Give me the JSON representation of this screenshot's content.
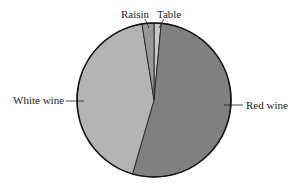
{
  "chart_data": {
    "type": "pie",
    "title": "",
    "categories": [
      "Table",
      "Red wine",
      "White wine",
      "Raisin"
    ],
    "values": [
      1.5,
      53,
      43,
      2.5
    ],
    "units": "percent (estimated)",
    "start_angle_deg": 0,
    "direction": "clockwise",
    "colors": {
      "Table": "#c8c8c8",
      "Red wine": "#808080",
      "White wine": "#b4b4b4",
      "Raisin": "#999999"
    },
    "labels": {
      "Table": "Table",
      "Red wine": "Red wine",
      "White wine": "White wine",
      "Raisin": "Raisin"
    },
    "legend": "none (callout labels)"
  }
}
